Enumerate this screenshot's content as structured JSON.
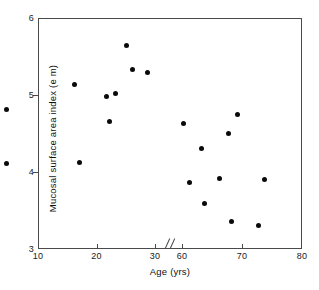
{
  "chart_data": {
    "type": "scatter",
    "title": "",
    "xlabel": "Age (yrs)",
    "ylabel": "Mucosal surface area index (e m)",
    "xlim": [
      10,
      80
    ],
    "ylim": [
      3,
      6
    ],
    "grid": false,
    "legend": null,
    "axis_break": {
      "axis": "x",
      "from": 30,
      "to": 60,
      "marker": "//"
    },
    "xticks": [
      10,
      20,
      30,
      60,
      70,
      80
    ],
    "xtick_labels": [
      "10",
      "20",
      "30",
      "60",
      "70",
      "80"
    ],
    "yticks": [
      3,
      4,
      5,
      6
    ],
    "ytick_labels": [
      "3",
      "4",
      "5",
      "6"
    ],
    "marker": {
      "shape": "circle",
      "color": "#0a0a0a",
      "size": 5
    },
    "points": [
      {
        "x": 16,
        "y": 5.15
      },
      {
        "x": 17,
        "y": 4.13
      },
      {
        "x": 21.5,
        "y": 5.0
      },
      {
        "x": 22,
        "y": 4.67
      },
      {
        "x": 23,
        "y": 5.03
      },
      {
        "x": 25,
        "y": 5.65
      },
      {
        "x": 26,
        "y": 5.35
      },
      {
        "x": 28.5,
        "y": 5.3
      },
      {
        "x": 30.5,
        "y": 4.82
      },
      {
        "x": 30.5,
        "y": 4.12
      },
      {
        "x": 60,
        "y": 4.64
      },
      {
        "x": 61,
        "y": 3.88
      },
      {
        "x": 63,
        "y": 4.32
      },
      {
        "x": 63.5,
        "y": 3.6
      },
      {
        "x": 66,
        "y": 3.93
      },
      {
        "x": 67.5,
        "y": 4.51
      },
      {
        "x": 68,
        "y": 3.37
      },
      {
        "x": 69,
        "y": 4.76
      },
      {
        "x": 72.5,
        "y": 3.32
      },
      {
        "x": 73.5,
        "y": 3.91
      }
    ]
  }
}
